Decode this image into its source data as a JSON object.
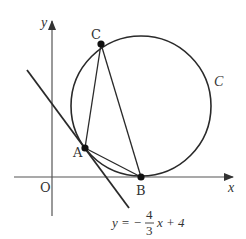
{
  "diagram": {
    "axes": {
      "x_label": "x",
      "y_label": "y",
      "origin_label": "O"
    },
    "circle": {
      "label": "C",
      "tangent_to_x_axis_at": "B"
    },
    "points": {
      "A": "A",
      "B": "B",
      "C": "C"
    },
    "line": {
      "equation_prefix": "y = −",
      "numerator": "4",
      "denominator": "3",
      "equation_suffix": "x + 4"
    },
    "colors": {
      "stroke": "#2a2a2a",
      "axis": "#555555",
      "text": "#333333"
    }
  }
}
